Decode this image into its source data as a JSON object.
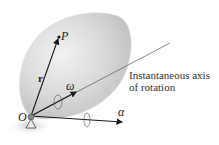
{
  "diagram": {
    "type": "rigid-body-rotation-about-fixed-point",
    "labels": {
      "point_p": "P",
      "position_vector": "r",
      "angular_velocity": "ω",
      "angular_acceleration": "α",
      "origin": "O",
      "axis_caption_line1": "Instantaneous axis",
      "axis_caption_line2": "of rotation"
    },
    "colors": {
      "body_fill": "#d6d6d6",
      "body_edge": "#eeeeee",
      "vector_stroke": "#1a1a1a",
      "axis_line": "#6a6a6a",
      "shadow": "#cfcfcf"
    }
  }
}
